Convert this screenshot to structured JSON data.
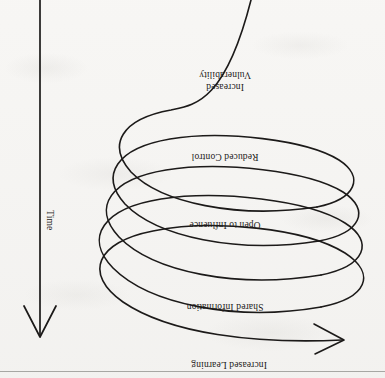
{
  "figure": {
    "type": "spiral-helix-diagram",
    "orientation": "rotated-180",
    "background_color": "#f4f3f1",
    "ink_color": "#1c1a19",
    "spiral": {
      "loop_count": 4,
      "direction": "expanding-downward",
      "terminator": "left-pointing-arrowhead",
      "stroke_width": 1.6
    },
    "time_axis": {
      "label": "Time",
      "direction": "downward",
      "terminator": "down-pointing-arrowhead"
    },
    "stage_labels": [
      {
        "id": "increased-vulnerability",
        "line1": "Increased",
        "line2": "Vulnerability",
        "full": "Increased Vulnerability"
      },
      {
        "id": "reduced-control",
        "full": "Reduced Control"
      },
      {
        "id": "open-to-influence",
        "full": "Open to Influence"
      },
      {
        "id": "shared-information",
        "full": "Shared Information"
      },
      {
        "id": "increased-learning",
        "full": "Increased Learning"
      }
    ]
  }
}
